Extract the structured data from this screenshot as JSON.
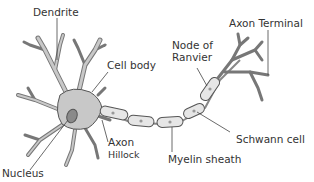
{
  "diagram": {
    "labels": {
      "dendrite": "Dendrite",
      "cell_body": "Cell body",
      "nucleus": "Nucleus",
      "axon_hillock_1": "Axon",
      "axon_hillock_2": "Hillock",
      "node_of_ranvier_1": "Node of",
      "node_of_ranvier_2": "Ranvier",
      "axon_terminal": "Axon Terminal",
      "schwann_cell": "Schwann cell",
      "myelin_sheath": "Myelin sheath"
    },
    "colors": {
      "cell_fill": "#c8c8c8",
      "outline": "#555555",
      "sheath_fill": "#e6e6e6",
      "nucleus_fill": "#8a8a8a",
      "text": "#333333"
    }
  }
}
